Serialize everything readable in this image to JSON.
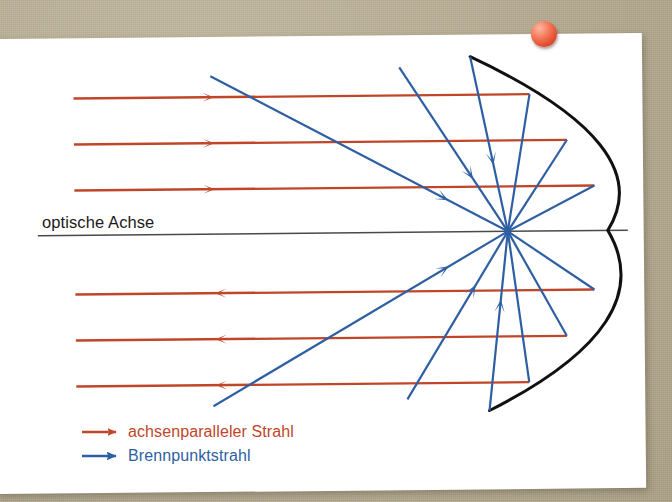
{
  "scene": {
    "background_color": "#b6ac93",
    "paper_color": "#ffffff",
    "pushpin_color": "#e0492c"
  },
  "diagram": {
    "axis_label": "optische Achse",
    "colors": {
      "ray_parallel": "#c0462a",
      "ray_focal": "#2e5fa3",
      "mirror": "#111111",
      "axis": "#4a4a4a"
    },
    "optical_axis": {
      "y": 233,
      "x_start": 38,
      "x_end": 628
    },
    "focal_point": {
      "x": 508,
      "y": 233
    },
    "mirror": {
      "vertex_x": 608,
      "top": {
        "x": 472,
        "y": 58
      },
      "bottom": {
        "x": 488,
        "y": 412
      },
      "stroke_width": 3
    },
    "parallel_rays": [
      {
        "y": 96,
        "x_start": 75,
        "x_end": 531,
        "direction": "right",
        "arrow_x": 215
      },
      {
        "y": 142,
        "x_start": 75,
        "x_end": 568,
        "direction": "right",
        "arrow_x": 215
      },
      {
        "y": 188,
        "x_start": 75,
        "x_end": 595,
        "direction": "right",
        "arrow_x": 215
      },
      {
        "y": 292,
        "x_start": 75,
        "x_end": 594,
        "direction": "left",
        "arrow_x": 215
      },
      {
        "y": 338,
        "x_start": 75,
        "x_end": 566,
        "direction": "left",
        "arrow_x": 215
      },
      {
        "y": 384,
        "x_start": 75,
        "x_end": 528,
        "direction": "left",
        "arrow_x": 215
      }
    ],
    "focal_rays": [
      {
        "name": "upper-long-diagonal",
        "x1": 212,
        "y1": 75,
        "x2": 508,
        "y2": 233,
        "arrow_at": 0.8
      },
      {
        "name": "upper-mirror-ray-1",
        "x1": 472,
        "y1": 58,
        "x2": 508,
        "y2": 233,
        "arrow_at": 0.62
      },
      {
        "name": "upper-mirror-ray-2",
        "x1": 401,
        "y1": 68,
        "x2": 508,
        "y2": 233,
        "arrow_at": 0.68
      },
      {
        "name": "upper-mirror-ray-3",
        "x1": 531,
        "y1": 96,
        "x2": 508,
        "y2": 233,
        "arrow_at": 0.0
      },
      {
        "name": "upper-mirror-ray-4",
        "x1": 568,
        "y1": 142,
        "x2": 508,
        "y2": 233,
        "arrow_at": 0.0
      },
      {
        "name": "upper-mirror-ray-5",
        "x1": 595,
        "y1": 188,
        "x2": 508,
        "y2": 233,
        "arrow_at": 0.0
      },
      {
        "name": "lower-long-diagonal",
        "x1": 212,
        "y1": 405,
        "x2": 508,
        "y2": 233,
        "arrow_at": 0.8
      },
      {
        "name": "lower-mirror-ray-1",
        "x1": 488,
        "y1": 412,
        "x2": 508,
        "y2": 233,
        "arrow_at": 0.62
      },
      {
        "name": "lower-mirror-ray-2",
        "x1": 406,
        "y1": 400,
        "x2": 508,
        "y2": 233,
        "arrow_at": 0.68
      },
      {
        "name": "lower-mirror-ray-3",
        "x1": 528,
        "y1": 384,
        "x2": 508,
        "y2": 233,
        "arrow_at": 0.0
      },
      {
        "name": "lower-mirror-ray-4",
        "x1": 566,
        "y1": 338,
        "x2": 508,
        "y2": 233,
        "arrow_at": 0.0
      },
      {
        "name": "lower-mirror-ray-5",
        "x1": 594,
        "y1": 292,
        "x2": 508,
        "y2": 233,
        "arrow_at": 0.0
      }
    ]
  },
  "legend": {
    "items": [
      {
        "label": "achsenparalleler Strahl",
        "color": "#c0462a"
      },
      {
        "label": "Brennpunktstrahl",
        "color": "#2e5fa3"
      }
    ]
  }
}
